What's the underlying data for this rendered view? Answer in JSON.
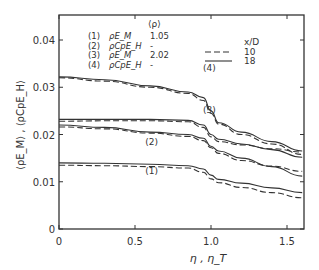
{
  "chart_data": {
    "type": "line",
    "title": "",
    "xlabel": "η , η_T",
    "ylabel": "⟨ρE_M⟩ , ⟨ρCpE_H⟩",
    "xlim": [
      0,
      1.6
    ],
    "ylim": [
      0,
      0.045
    ],
    "xticks": [
      "0",
      "0.5",
      "1.0",
      "1.5"
    ],
    "yticks": [
      "0",
      "0.01",
      "0.02",
      "0.03",
      "0.04"
    ],
    "grid": false,
    "legend": {
      "header": "⟨ρ⟩",
      "entries": [
        {
          "id": "(1)",
          "quantity": "ρE_M",
          "rho": "1.05"
        },
        {
          "id": "(2)",
          "quantity": "ρCpE_H",
          "rho": "-"
        },
        {
          "id": "(3)",
          "quantity": "ρE_M",
          "rho": "2.02"
        },
        {
          "id": "(4)",
          "quantity": "ρCpE_H",
          "rho": "-"
        }
      ],
      "style_header": "x/D",
      "styles": [
        {
          "dash": "dashed",
          "label": "10"
        },
        {
          "dash": "solid",
          "label": "18"
        }
      ]
    },
    "x": [
      0,
      0.3,
      0.6,
      0.85,
      0.95,
      1.0,
      1.05,
      1.2,
      1.4,
      1.6
    ],
    "series": [
      {
        "name": "(4) x/D=18",
        "curve": "4",
        "style": "solid",
        "values": [
          0.0322,
          0.0316,
          0.0303,
          0.029,
          0.0278,
          0.025,
          0.0225,
          0.0205,
          0.0185,
          0.0165
        ]
      },
      {
        "name": "(4) x/D=10",
        "curve": "4",
        "style": "dashed",
        "values": [
          0.032,
          0.0313,
          0.03,
          0.0287,
          0.0272,
          0.0245,
          0.0222,
          0.02,
          0.018,
          0.0158
        ]
      },
      {
        "name": "(3) x/D=18",
        "curve": "3",
        "style": "solid",
        "values": [
          0.0232,
          0.0232,
          0.0232,
          0.023,
          0.022,
          0.02,
          0.019,
          0.018,
          0.0168,
          0.0152
        ]
      },
      {
        "name": "(3) x/D=10",
        "curve": "3",
        "style": "dashed",
        "values": [
          0.0228,
          0.0229,
          0.0229,
          0.0227,
          0.0215,
          0.0195,
          0.0185,
          0.0178,
          0.017,
          0.0163
        ]
      },
      {
        "name": "(2) x/D=18",
        "curve": "2",
        "style": "solid",
        "values": [
          0.022,
          0.0215,
          0.0205,
          0.02,
          0.0192,
          0.0175,
          0.0165,
          0.015,
          0.0132,
          0.0112
        ]
      },
      {
        "name": "(2) x/D=10",
        "curve": "2",
        "style": "dashed",
        "values": [
          0.0216,
          0.0212,
          0.0203,
          0.0196,
          0.0187,
          0.0172,
          0.016,
          0.0145,
          0.0133,
          0.0122
        ]
      },
      {
        "name": "(1) x/D=18",
        "curve": "1",
        "style": "solid",
        "values": [
          0.014,
          0.0139,
          0.0137,
          0.0134,
          0.0127,
          0.0114,
          0.0105,
          0.0097,
          0.0087,
          0.0077
        ]
      },
      {
        "name": "(1) x/D=10",
        "curve": "1",
        "style": "dashed",
        "values": [
          0.0135,
          0.0134,
          0.0132,
          0.0129,
          0.012,
          0.0106,
          0.0098,
          0.0088,
          0.0077,
          0.0066
        ]
      }
    ],
    "annotations": [
      {
        "text": "(4)",
        "x": 1.0,
        "y": 0.0335
      },
      {
        "text": "(3)",
        "x": 1.0,
        "y": 0.0245
      },
      {
        "text": "(2)",
        "x": 0.62,
        "y": 0.0178
      },
      {
        "text": "(1)",
        "x": 0.62,
        "y": 0.0117
      }
    ]
  }
}
